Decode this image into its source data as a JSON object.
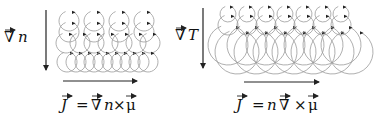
{
  "panels": [
    {
      "id": "density-gradient",
      "gradient_label": {
        "symbol": "∇",
        "variable": "n"
      },
      "formula": {
        "lhs": "J",
        "eq": "=",
        "rhs_parts": [
          "∇",
          "n",
          "×",
          "μ"
        ],
        "text": "J = ∇n × μ"
      },
      "gradient_arrow": {
        "x": 46,
        "y1": 10,
        "y2": 70
      },
      "current_arrow": {
        "x1": 63,
        "x2": 137,
        "y": 81
      },
      "orbit_rows": [
        {
          "cy": 21,
          "r": 10,
          "xs": [
            69,
            94,
            119,
            144
          ]
        },
        {
          "cy": 32,
          "r": 10,
          "xs": [
            69,
            94,
            119,
            144
          ]
        },
        {
          "cy": 43,
          "r": 10,
          "xs": [
            66,
            80,
            94,
            108,
            122,
            136,
            150
          ]
        },
        {
          "cy": 62,
          "r": 10,
          "xs": [
            67,
            76,
            85,
            94,
            103,
            112,
            121,
            130,
            139,
            148
          ]
        }
      ]
    },
    {
      "id": "temperature-gradient",
      "gradient_label": {
        "symbol": "∇",
        "variable": "T"
      },
      "formula": {
        "lhs": "J",
        "eq": "=",
        "rhs_parts": [
          "n",
          "∇",
          "×",
          "μ"
        ],
        "text": "J = n ∇ × μ"
      },
      "gradient_arrow": {
        "x": 203,
        "y1": 8,
        "y2": 68
      },
      "current_arrow": {
        "x1": 244,
        "x2": 319,
        "y": 82
      },
      "orbit_rows": [
        {
          "cy": 14,
          "r": 8,
          "xs": [
            228,
            247,
            266,
            285,
            304,
            323,
            341
          ]
        },
        {
          "cy": 25,
          "r": 10,
          "xs": [
            228,
            247,
            266,
            285,
            304,
            323,
            341
          ]
        },
        {
          "cy": 45,
          "r": 20,
          "xs": [
            228,
            247,
            266,
            285,
            304,
            323,
            341
          ]
        },
        {
          "cy": 52,
          "r": 22,
          "xs": [
            237,
            256,
            275,
            294,
            313,
            332,
            351
          ]
        }
      ]
    }
  ],
  "colors": {
    "ink": "#222222",
    "orbit": "#9a9a9a",
    "background": "#ffffff"
  }
}
